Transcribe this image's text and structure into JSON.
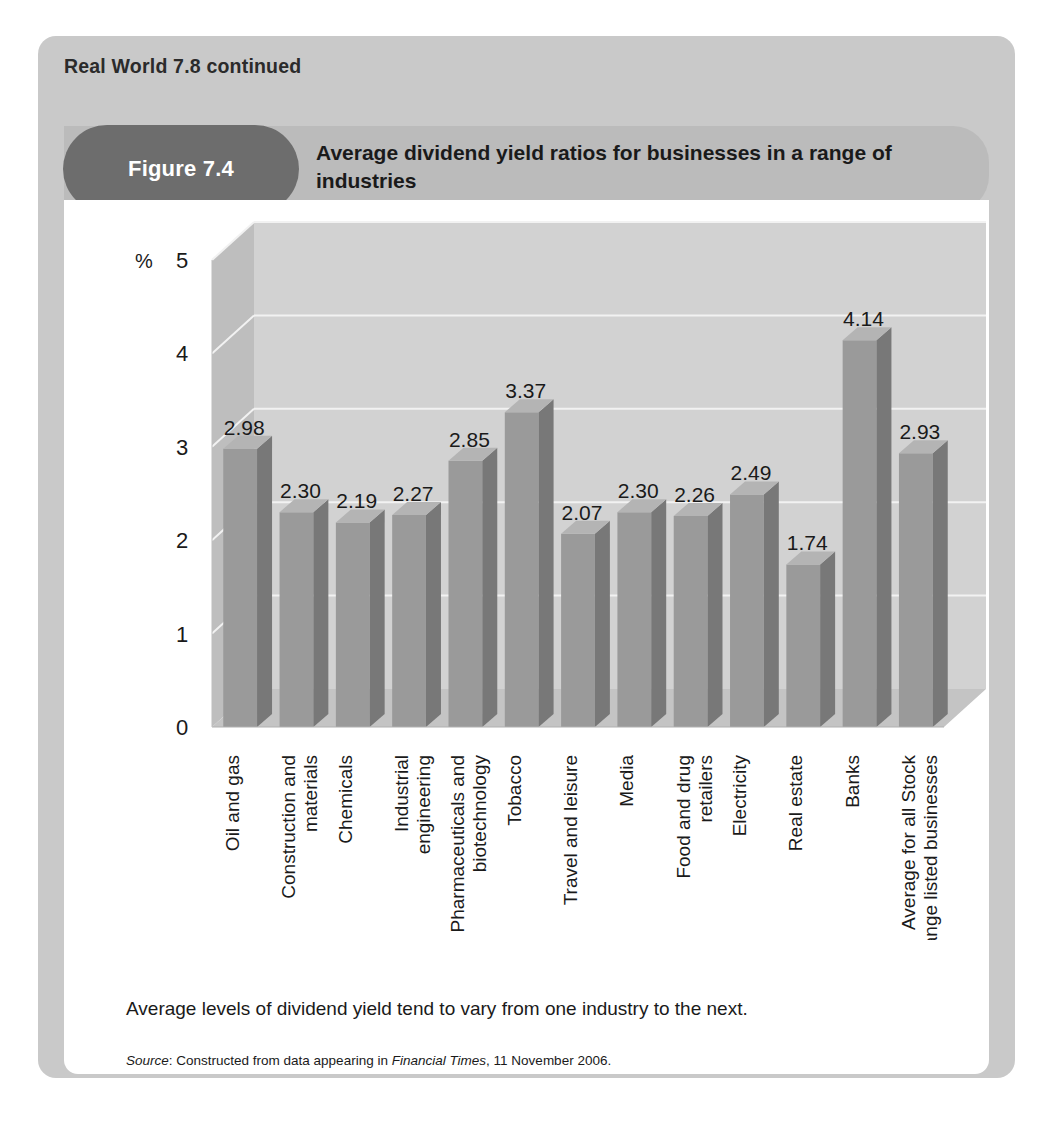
{
  "page": {
    "section_heading": "Real World 7.8 continued",
    "figure_badge": "Figure 7.4",
    "figure_title": "Average dividend yield ratios for businesses in a range of industries",
    "caption": "Average levels of dividend yield tend to vary from one industry to the next.",
    "source": {
      "label": "Source",
      "prefix": ": Constructed from data appearing in ",
      "publication": "Financial Times",
      "suffix": ", 11 November 2006."
    }
  },
  "colors": {
    "outer_panel": "#c9c9c9",
    "title_band": "#bbbbbb",
    "badge": "#6d6d6d",
    "card": "#ffffff",
    "wall_back": "#d2d2d2",
    "wall_side": "#bebebe",
    "floor": "#c4c4c4",
    "bar_front": "#9a9a9a",
    "bar_side": "#787878",
    "bar_top": "#b4b4b4",
    "gridline": "#f2f2f2",
    "text": "#1a1a1a"
  },
  "chart_data": {
    "type": "bar",
    "title": "Average dividend yield ratios for businesses in a range of industries",
    "xlabel": "",
    "ylabel": "%",
    "ylim": [
      0,
      5
    ],
    "yticks": [
      0,
      1,
      2,
      3,
      4,
      5
    ],
    "grid": true,
    "legend": "none",
    "three_d": true,
    "value_label_format": "0.00",
    "categories": [
      "Oil and gas",
      "Construction and materials",
      "Chemicals",
      "Industrial engineering",
      "Pharmaceuticals and biotechnology",
      "Tobacco",
      "Travel and leisure",
      "Media",
      "Food and drug retailers",
      "Electricity",
      "Real estate",
      "Banks",
      "Average for all Stock Exchange listed businesses"
    ],
    "values": [
      2.98,
      2.3,
      2.19,
      2.27,
      2.85,
      3.37,
      2.07,
      2.3,
      2.26,
      2.49,
      1.74,
      4.14,
      2.93
    ],
    "value_labels": [
      "2.98",
      "2.30",
      "2.19",
      "2.27",
      "2.85",
      "3.37",
      "2.07",
      "2.30",
      "2.26",
      "2.49",
      "1.74",
      "4.14",
      "2.93"
    ]
  }
}
